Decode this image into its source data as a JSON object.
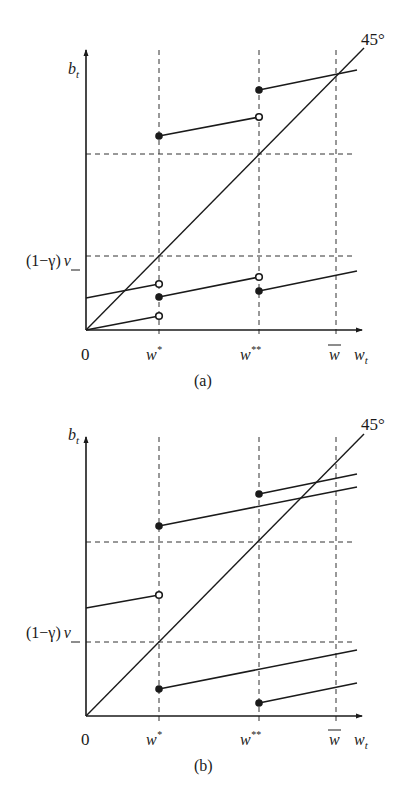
{
  "figure": {
    "panels": [
      {
        "id": "a",
        "caption": "(a)",
        "y_axis_label": "b",
        "y_axis_sub": "t",
        "x_axis_label": "w",
        "x_axis_sub": "t",
        "origin_label": "0",
        "angle_label": "45°",
        "hline_label": "(1−γ)",
        "hline_label_nu": "ν",
        "x_ticks": [
          "w*",
          "w**",
          "w̅"
        ],
        "tick_w1": "w",
        "tick_w1_sup": "*",
        "tick_w2": "w",
        "tick_w2_sup": "**",
        "tick_wbar": "w"
      },
      {
        "id": "b",
        "caption": "(b)",
        "y_axis_label": "b",
        "y_axis_sub": "t",
        "x_axis_label": "w",
        "x_axis_sub": "t",
        "origin_label": "0",
        "angle_label": "45°",
        "hline_label": "(1−γ)",
        "hline_label_nu": "ν",
        "tick_w1": "w",
        "tick_w1_sup": "*",
        "tick_w2": "w",
        "tick_w2_sup": "**",
        "tick_wbar": "w"
      }
    ],
    "colors": {
      "ink": "#1a1a1a",
      "background": "#ffffff"
    }
  }
}
